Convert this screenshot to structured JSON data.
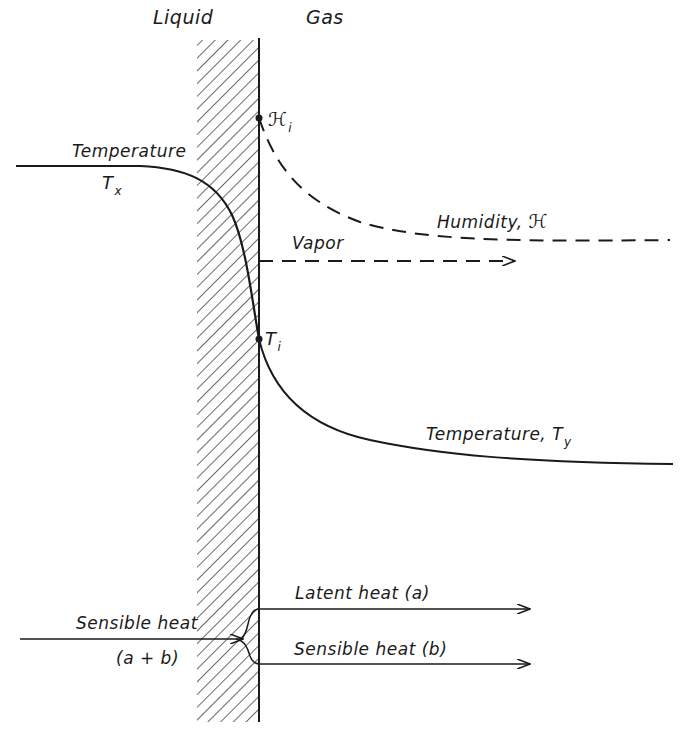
{
  "diagram": {
    "regions": {
      "liquid": "Liquid",
      "gas": "Gas"
    },
    "curves": {
      "liquid_temperature": {
        "label": "Temperature",
        "symbol": "T",
        "subscript": "x",
        "style": "solid"
      },
      "interface_humidity": {
        "symbol": "ℋ",
        "subscript": "i"
      },
      "gas_humidity": {
        "label": "Humidity, ",
        "symbol": "ℋ",
        "style": "dashed"
      },
      "interface_temperature": {
        "symbol": "T",
        "subscript": "i"
      },
      "gas_temperature": {
        "label": "Temperature, ",
        "symbol": "T",
        "subscript": "y",
        "style": "solid"
      }
    },
    "arrows": {
      "vapor": {
        "label": "Vapor",
        "style": "dashed"
      },
      "incoming_sensible": {
        "label": "Sensible heat",
        "sublabel": "(a + b)"
      },
      "latent": {
        "label": "Latent heat (a)"
      },
      "outgoing_sensible": {
        "label": "Sensible heat (b)"
      }
    },
    "colors": {
      "ink": "#1a1a1a",
      "background": "#ffffff"
    }
  }
}
